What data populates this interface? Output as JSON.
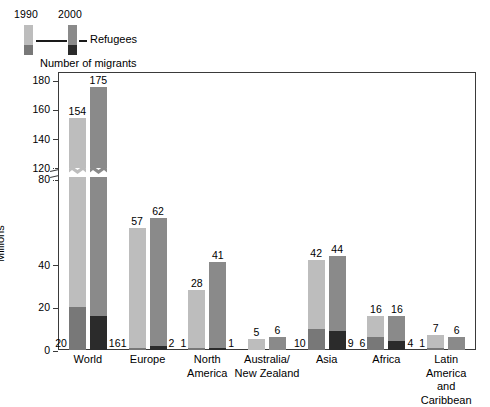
{
  "legend": {
    "year_1990": "1990",
    "year_2000": "2000",
    "refugees_label": "Refugees",
    "migrants_label": "Number of migrants"
  },
  "axis": {
    "ylabel": "Millions",
    "yticks": [
      "0",
      "20",
      "40",
      "80",
      "120",
      "140",
      "160",
      "180"
    ],
    "break_note": "axis break between 80 and 120"
  },
  "chart_data": {
    "type": "bar",
    "title": "",
    "subtitle": "",
    "xlabel": "",
    "ylabel": "Millions",
    "ylim": [
      0,
      180
    ],
    "axis_break": {
      "from": 80,
      "to": 120
    },
    "grid": false,
    "legend_position": "top-left",
    "stacked": true,
    "colors": {
      "migrants_1990": "#bdbdbd",
      "refugees_1990": "#787878",
      "migrants_2000": "#8a8a8a",
      "refugees_2000": "#2b2b2b",
      "frame": "#3a3a3a"
    },
    "categories": [
      "World",
      "Europe",
      "North America",
      "Australia/ New Zealand",
      "Asia",
      "Africa",
      "Latin America and Caribbean"
    ],
    "category_lines": [
      [
        "World"
      ],
      [
        "Europe"
      ],
      [
        "North",
        "America"
      ],
      [
        "Australia/",
        "New Zealand"
      ],
      [
        "Asia"
      ],
      [
        "Africa"
      ],
      [
        "Latin America",
        "and Caribbean"
      ]
    ],
    "series": [
      {
        "name": "1990 total migrants",
        "values": [
          154,
          57,
          28,
          5,
          42,
          16,
          7
        ]
      },
      {
        "name": "1990 refugees",
        "values": [
          20,
          1,
          1,
          0,
          10,
          6,
          1
        ]
      },
      {
        "name": "2000 total migrants",
        "values": [
          175,
          62,
          41,
          6,
          44,
          16,
          6
        ]
      },
      {
        "name": "2000 refugees",
        "values": [
          16,
          2,
          1,
          0,
          9,
          4,
          0
        ]
      }
    ],
    "value_labels": {
      "total_1990": [
        "154",
        "57",
        "28",
        "5",
        "42",
        "16",
        "7"
      ],
      "total_2000": [
        "175",
        "62",
        "41",
        "6",
        "44",
        "16",
        "6"
      ],
      "refugees_1990": [
        "20",
        "1",
        "1",
        "",
        "10",
        "6",
        "1"
      ],
      "refugees_2000": [
        "16",
        "2",
        "1",
        "",
        "9",
        "4",
        ""
      ]
    }
  }
}
